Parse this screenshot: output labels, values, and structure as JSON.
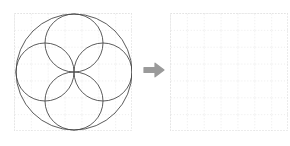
{
  "figure": {
    "type": "geometric-construction-transformation",
    "title": "",
    "background_color": "#ffffff",
    "width": 290,
    "height": 146
  },
  "grid": {
    "cell_size": 16.857,
    "columns": 7,
    "rows": 7,
    "line_color": "#d8d8d8",
    "style": "dotted",
    "dash": "1,2"
  },
  "panels": [
    {
      "name": "source-panel",
      "label": "",
      "x": 14,
      "y": 13,
      "width": 118,
      "height": 118,
      "empty": false
    },
    {
      "name": "target-panel",
      "label": "",
      "x": 170,
      "y": 13,
      "width": 118,
      "height": 118,
      "empty": true
    }
  ],
  "drawing": {
    "stroke_color": "#4a4a4a",
    "stroke_width": 0.9,
    "fill": "none",
    "center": {
      "x": 74,
      "y": 72
    },
    "shapes": [
      {
        "name": "outer-circle",
        "kind": "circle",
        "cx": 74,
        "cy": 72,
        "r": 58
      },
      {
        "name": "inner-circle-top",
        "kind": "circle",
        "cx": 74,
        "cy": 43,
        "r": 29
      },
      {
        "name": "inner-circle-right",
        "kind": "circle",
        "cx": 103,
        "cy": 72,
        "r": 29
      },
      {
        "name": "inner-circle-bottom",
        "kind": "circle",
        "cx": 74,
        "cy": 101,
        "r": 29
      },
      {
        "name": "inner-circle-left",
        "kind": "circle",
        "cx": 45,
        "cy": 72,
        "r": 29
      }
    ],
    "description": "Quatrefoil rosette: one large circle with four half-radius circles internally tangent to it and meeting at the common center"
  },
  "arrow": {
    "name": "right-arrow",
    "icon": "arrow-right-icon",
    "color": "#9a9a9a",
    "x": 142,
    "y": 58,
    "width": 24,
    "height": 24,
    "direction": "right"
  }
}
